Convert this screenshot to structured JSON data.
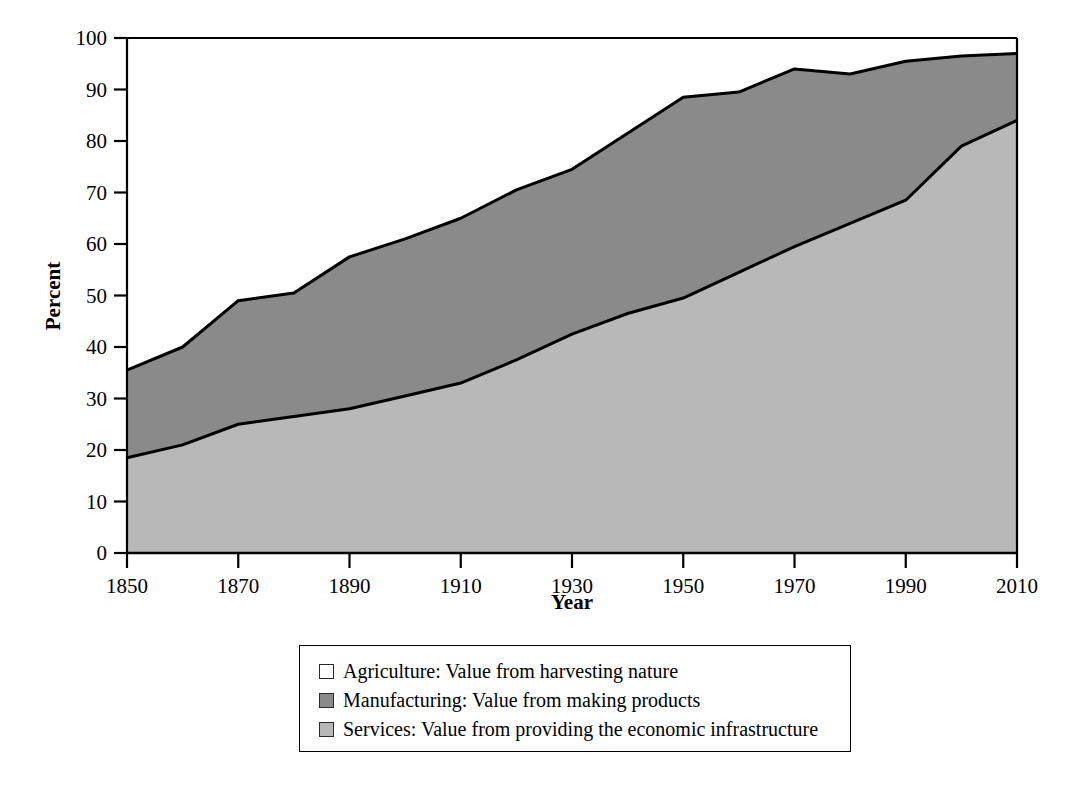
{
  "chart_data": {
    "type": "area",
    "stacked": true,
    "title": "",
    "xlabel": "Year",
    "ylabel": "Percent",
    "xlim": [
      1850,
      2010
    ],
    "ylim": [
      0,
      100
    ],
    "xticks": [
      1850,
      1870,
      1890,
      1910,
      1930,
      1950,
      1970,
      1990,
      2010
    ],
    "yticks": [
      0,
      10,
      20,
      30,
      40,
      50,
      60,
      70,
      80,
      90,
      100
    ],
    "grid": false,
    "legend_position": "below",
    "x": [
      1850,
      1860,
      1870,
      1880,
      1890,
      1900,
      1910,
      1920,
      1930,
      1940,
      1950,
      1960,
      1970,
      1980,
      1990,
      2000,
      2010
    ],
    "series": [
      {
        "name": "Services",
        "label": "Services: Value from providing the economic infrastructure",
        "color": "#b8b8b8",
        "values": [
          18.5,
          21.0,
          25.0,
          26.5,
          28.0,
          30.5,
          33.0,
          37.5,
          42.5,
          46.5,
          49.5,
          54.5,
          59.5,
          64.0,
          68.5,
          79.0,
          84.0
        ]
      },
      {
        "name": "Manufacturing",
        "label": "Manufacturing: Value from making products",
        "color": "#8a8a8a",
        "values": [
          17.0,
          19.0,
          24.0,
          24.0,
          29.5,
          30.5,
          32.0,
          33.0,
          32.0,
          35.0,
          39.0,
          35.0,
          34.5,
          29.0,
          27.0,
          17.5,
          13.0
        ]
      },
      {
        "name": "Agriculture",
        "label": "Agriculture: Value from harvesting nature",
        "color": "#ffffff",
        "values": [
          64.5,
          60.0,
          51.0,
          49.5,
          42.5,
          39.0,
          35.0,
          29.5,
          25.5,
          18.5,
          11.5,
          10.5,
          6.0,
          7.0,
          4.5,
          3.5,
          3.0
        ]
      }
    ],
    "cumulative_upper_boundaries": {
      "services_top": [
        18.5,
        21.0,
        25.0,
        26.5,
        28.0,
        30.5,
        33.0,
        37.5,
        42.5,
        46.5,
        49.5,
        54.5,
        59.5,
        64.0,
        68.5,
        79.0,
        84.0
      ],
      "manufacturing_top": [
        35.5,
        40.0,
        49.0,
        50.5,
        57.5,
        61.0,
        65.0,
        70.5,
        74.5,
        81.5,
        88.5,
        89.5,
        94.0,
        93.0,
        95.5,
        96.5,
        97.0
      ]
    }
  },
  "axes": {
    "ylabel": "Percent",
    "xlabel": "Year",
    "xtick_labels": [
      "1850",
      "1870",
      "1890",
      "1910",
      "1930",
      "1950",
      "1970",
      "1990",
      "2010"
    ],
    "ytick_labels": [
      "0",
      "10",
      "20",
      "30",
      "40",
      "50",
      "60",
      "70",
      "80",
      "90",
      "100"
    ]
  },
  "legend": {
    "items": [
      {
        "swatch_color": "#ffffff",
        "swatch_name": "agriculture-swatch",
        "label": "Agriculture: Value from harvesting nature"
      },
      {
        "swatch_color": "#8a8a8a",
        "swatch_name": "manufacturing-swatch",
        "label": "Manufacturing: Value from making products"
      },
      {
        "swatch_color": "#b8b8b8",
        "swatch_name": "services-swatch",
        "label": "Services: Value from providing the economic infrastructure"
      }
    ]
  },
  "colors": {
    "agriculture": "#ffffff",
    "manufacturing": "#8a8a8a",
    "services": "#b8b8b8",
    "axis": "#000000",
    "background": "#ffffff"
  }
}
